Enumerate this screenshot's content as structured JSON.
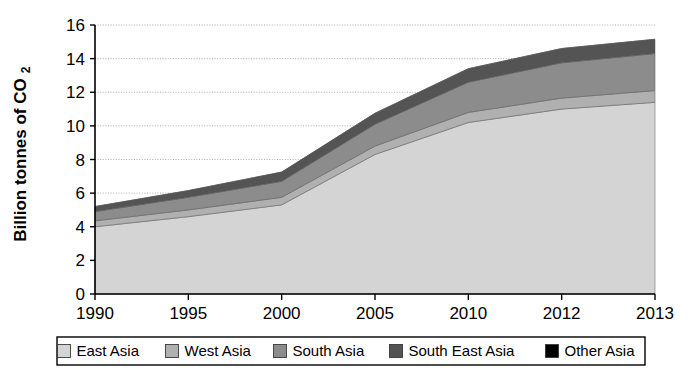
{
  "chart_data": {
    "type": "area",
    "stacked": true,
    "title": "",
    "subtitle": "",
    "xlabel": "",
    "ylabel": "Billion tonnes of CO2",
    "ylabel_main": "Billion tonnes of CO",
    "ylabel_subscript": "2",
    "categories": [
      "1990",
      "1995",
      "2000",
      "2005",
      "2010",
      "2012",
      "2013"
    ],
    "x_tick_labels": [
      "1990",
      "1995",
      "2000",
      "2005",
      "2010",
      "2012",
      "2013"
    ],
    "y_tick_labels": [
      "0",
      "2",
      "4",
      "6",
      "8",
      "10",
      "12",
      "14",
      "16"
    ],
    "y_ticks": [
      0,
      2,
      4,
      6,
      8,
      10,
      12,
      14,
      16
    ],
    "ylim": [
      0,
      16
    ],
    "grid": true,
    "grid_axis": "y",
    "legend_position": "bottom",
    "series": [
      {
        "name": "East Asia",
        "color": "#d4d4d4",
        "values": [
          4.0,
          4.6,
          5.3,
          8.3,
          10.2,
          11.0,
          11.4
        ]
      },
      {
        "name": "West Asia",
        "color": "#b0b0b0",
        "values": [
          0.35,
          0.4,
          0.45,
          0.5,
          0.6,
          0.65,
          0.7
        ]
      },
      {
        "name": "South Asia",
        "color": "#8c8c8c",
        "values": [
          0.55,
          0.75,
          0.95,
          1.3,
          1.8,
          2.1,
          2.2
        ]
      },
      {
        "name": "South East Asia",
        "color": "#545454",
        "values": [
          0.3,
          0.4,
          0.55,
          0.65,
          0.8,
          0.85,
          0.85
        ]
      },
      {
        "name": "Other Asia",
        "color": "#000000",
        "values": [
          0.0,
          0.0,
          0.0,
          0.0,
          0.0,
          0.0,
          0.0
        ]
      }
    ],
    "totals": [
      5.2,
      6.15,
      7.25,
      10.75,
      13.4,
      14.6,
      15.15
    ]
  },
  "legend": {
    "items": [
      {
        "label": "East Asia",
        "color": "#d4d4d4"
      },
      {
        "label": "West Asia",
        "color": "#b0b0b0"
      },
      {
        "label": "South Asia",
        "color": "#8c8c8c"
      },
      {
        "label": "South East Asia",
        "color": "#545454"
      },
      {
        "label": "Other Asia",
        "color": "#000000"
      }
    ]
  },
  "colors": {
    "axis": "#000000",
    "grid": "#9a9a9a",
    "background": "#ffffff",
    "legend_border": "#000000"
  }
}
